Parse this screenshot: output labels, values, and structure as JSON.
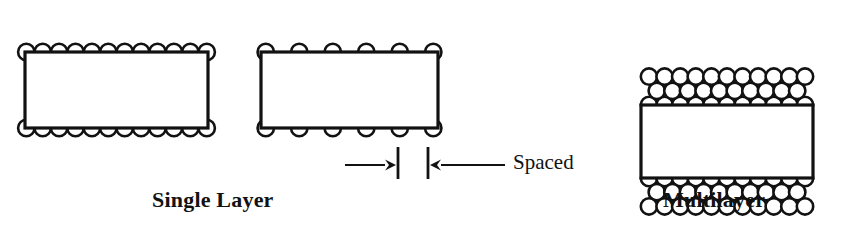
{
  "figure": {
    "type": "technical-diagram",
    "background_color": "#ffffff",
    "line_color": "#121212",
    "fill_color": "#ffffff"
  },
  "captions": {
    "single_layer": "Single Layer",
    "multilayer": "Multilayer",
    "spaced": "Spaced"
  },
  "panels": [
    {
      "id": "single-layer-close-wound",
      "caption_ref": "single_layer",
      "core": {
        "x": 25,
        "y": 52,
        "width": 183,
        "height": 76
      },
      "winding": {
        "style": "close-wound",
        "layers": 1,
        "turns_top": 12,
        "turns_bottom": 12,
        "circle_radius": 8.2,
        "pitch": 16.4
      }
    },
    {
      "id": "single-layer-spaced",
      "caption_ref": "single_layer",
      "core": {
        "x": 261,
        "y": 52,
        "width": 177,
        "height": 76
      },
      "winding": {
        "style": "spaced",
        "layers": 1,
        "turns_top": 6,
        "turns_bottom": 6,
        "circle_radius": 8.2,
        "pitch": 33.5
      },
      "dimension": {
        "label_ref": "spaced",
        "tick_x_left": 398,
        "tick_x_right": 428,
        "tick_y_top": 147,
        "tick_y_bottom": 179,
        "arrow_y": 165,
        "left_arrow_from_x": 345,
        "right_arrow_from_x": 505
      }
    },
    {
      "id": "multilayer",
      "caption_ref": "multilayer",
      "core": {
        "x": 641,
        "y": 105,
        "width": 172,
        "height": 73
      },
      "winding": {
        "style": "close-wound",
        "layers": 3,
        "turns_per_layer": 11,
        "circle_radius": 8.2,
        "pitch": 15.6,
        "row_spacing": 14.2
      }
    }
  ],
  "chart_data": {
    "type": "diagram",
    "title": "",
    "elements": [
      {
        "name": "single-layer-close-wound",
        "turns_per_side": 12,
        "layers": 1
      },
      {
        "name": "single-layer-spaced",
        "turns_per_side": 6,
        "layers": 1,
        "annotation": "Spaced"
      },
      {
        "name": "multilayer",
        "turns_per_side": 11,
        "layers": 3
      }
    ]
  }
}
